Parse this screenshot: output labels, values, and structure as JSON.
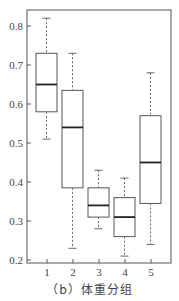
{
  "chart_data": {
    "type": "box",
    "title": "",
    "caption": "（b）体重分组",
    "xlabel": "",
    "ylabel": "",
    "categories": [
      "1",
      "2",
      "3",
      "4",
      "5"
    ],
    "ylim": [
      0.185,
      0.85
    ],
    "yticks": [
      0.2,
      0.3,
      0.4,
      0.5,
      0.6,
      0.7,
      0.8
    ],
    "ytick_labels": [
      "0.2",
      "0.3",
      "0.4",
      "0.5",
      "0.6",
      "0.7",
      "0.8"
    ],
    "grid": false,
    "legend": null,
    "boxes": [
      {
        "group": "1",
        "whisker_low": 0.51,
        "q1": 0.58,
        "median": 0.65,
        "q3": 0.73,
        "whisker_high": 0.82
      },
      {
        "group": "2",
        "whisker_low": 0.23,
        "q1": 0.385,
        "median": 0.54,
        "q3": 0.635,
        "whisker_high": 0.73
      },
      {
        "group": "3",
        "whisker_low": 0.28,
        "q1": 0.31,
        "median": 0.34,
        "q3": 0.385,
        "whisker_high": 0.43
      },
      {
        "group": "4",
        "whisker_low": 0.21,
        "q1": 0.26,
        "median": 0.31,
        "q3": 0.36,
        "whisker_high": 0.41
      },
      {
        "group": "5",
        "whisker_low": 0.24,
        "q1": 0.345,
        "median": 0.45,
        "q3": 0.57,
        "whisker_high": 0.68
      }
    ]
  },
  "colors": {
    "axis": "#555555",
    "box": "#555555",
    "median": "#222222",
    "whisker": "#666666"
  }
}
